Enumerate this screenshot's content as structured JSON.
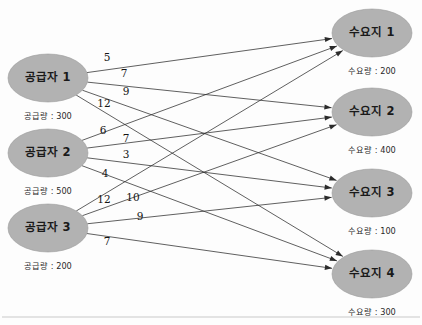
{
  "diagram": {
    "type": "bipartite-transportation-network",
    "supply_label_prefix": "공급량",
    "demand_label_prefix": "수요량",
    "separator": " : ",
    "suppliers": [
      {
        "id": "s1",
        "label": "공급자 1",
        "sub": "공급량 : 300",
        "amount": 300,
        "cx": 48,
        "cy": 78
      },
      {
        "id": "s2",
        "label": "공급자 2",
        "sub": "공급량 : 500",
        "amount": 500,
        "cx": 48,
        "cy": 153
      },
      {
        "id": "s3",
        "label": "공급자 3",
        "sub": "공급량 : 200",
        "amount": 200,
        "cx": 48,
        "cy": 228
      }
    ],
    "destinations": [
      {
        "id": "d1",
        "label": "수요지 1",
        "sub": "수요량 : 200",
        "amount": 200,
        "cx": 372,
        "cy": 33
      },
      {
        "id": "d2",
        "label": "수요지 2",
        "sub": "수요량 : 400",
        "amount": 400,
        "cx": 372,
        "cy": 112
      },
      {
        "id": "d3",
        "label": "수요지 3",
        "sub": "수요량 : 100",
        "amount": 100,
        "cx": 372,
        "cy": 193
      },
      {
        "id": "d4",
        "label": "수요지 4",
        "sub": "수요량 : 300",
        "amount": 300,
        "cx": 372,
        "cy": 274
      }
    ],
    "edges": [
      {
        "from": "s1",
        "to": "d1",
        "cost": 5,
        "label_x": 107,
        "label_y": 58
      },
      {
        "from": "s1",
        "to": "d2",
        "cost": 7,
        "label_x": 124,
        "label_y": 74
      },
      {
        "from": "s1",
        "to": "d3",
        "cost": 9,
        "label_x": 126,
        "label_y": 92
      },
      {
        "from": "s1",
        "to": "d4",
        "cost": 12,
        "label_x": 104,
        "label_y": 104
      },
      {
        "from": "s2",
        "to": "d1",
        "cost": 6,
        "label_x": 103,
        "label_y": 131
      },
      {
        "from": "s2",
        "to": "d2",
        "cost": 7,
        "label_x": 126,
        "label_y": 139
      },
      {
        "from": "s2",
        "to": "d3",
        "cost": 3,
        "label_x": 126,
        "label_y": 155
      },
      {
        "from": "s2",
        "to": "d4",
        "cost": 4,
        "label_x": 105,
        "label_y": 174
      },
      {
        "from": "s3",
        "to": "d1",
        "cost": 12,
        "label_x": 104,
        "label_y": 200
      },
      {
        "from": "s3",
        "to": "d2",
        "cost": 10,
        "label_x": 133,
        "label_y": 198
      },
      {
        "from": "s3",
        "to": "d3",
        "cost": 9,
        "label_x": 140,
        "label_y": 217
      },
      {
        "from": "s3",
        "to": "d4",
        "cost": 7,
        "label_x": 107,
        "label_y": 242
      }
    ],
    "node_geometry": {
      "rx": 40,
      "ry": 24,
      "label_dy": -1,
      "sub_dy": 38
    },
    "colors": {
      "node_fill": "#b2b2b2",
      "node_stroke": "#9a9a9a",
      "edge": "#2b2b2b",
      "text": "#1a1a1a",
      "background": "#fdfdfd",
      "rule": "#c9c9c9"
    },
    "bottom_rule": {
      "x1": 2,
      "y1": 317,
      "x2": 420,
      "y2": 317
    }
  }
}
